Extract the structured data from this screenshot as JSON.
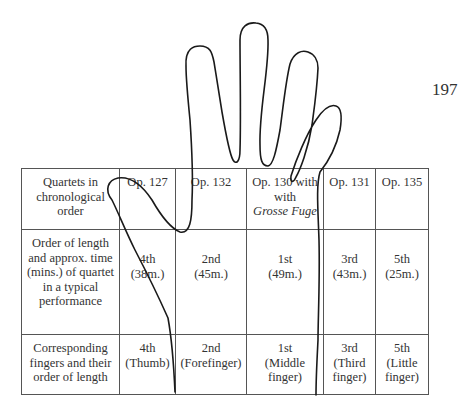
{
  "page": {
    "number": "197"
  },
  "table": {
    "rows": [
      {
        "label": "Quartets in chronological order",
        "cells": [
          {
            "line1": "Op. 127"
          },
          {
            "line1": "Op. 132"
          },
          {
            "line1": "Op. 130 with",
            "line2": "with",
            "line3": "Grosse Fuge"
          },
          {
            "line1": "Op. 131"
          },
          {
            "line1": "Op. 135"
          }
        ]
      },
      {
        "label": "Order of length and approx. time (mins.) of quartet in a typical performance",
        "cells": [
          {
            "line1": "4th",
            "line2": "(38m.)"
          },
          {
            "line1": "2nd",
            "line2": "(45m.)"
          },
          {
            "line1": "1st",
            "line2": "(49m.)"
          },
          {
            "line1": "3rd",
            "line2": "(43m.)"
          },
          {
            "line1": "5th",
            "line2": "(25m.)"
          }
        ]
      },
      {
        "label": "Corresponding fingers and their order of length",
        "cells": [
          {
            "line1": "4th",
            "line2": "(Thumb)"
          },
          {
            "line1": "2nd",
            "line2": "(Forefinger)"
          },
          {
            "line1": "1st",
            "line2": "(Middle",
            "line3": "finger)"
          },
          {
            "line1": "3rd",
            "line2": "(Third",
            "line3": "finger)"
          },
          {
            "line1": "5th",
            "line2": "(Little",
            "line3": "finger)"
          }
        ]
      }
    ]
  },
  "drawing": {
    "subject": "hand-outline",
    "stroke_color": "#1a1a1a"
  }
}
